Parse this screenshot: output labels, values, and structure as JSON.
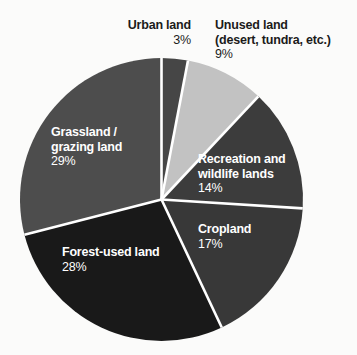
{
  "chart_data": {
    "type": "pie",
    "title": "",
    "subtitle": "",
    "xlabel": "",
    "ylabel": "",
    "legend_position": "none",
    "grid": false,
    "unit": "%",
    "start_angle_deg": 0,
    "direction": "clockwise",
    "categories": [
      "Urban land",
      "Unused land (desert, tundra, etc.)",
      "Recreation and wildlife lands",
      "Cropland",
      "Forest-used land",
      "Grassland / grazing land"
    ],
    "values": [
      3,
      9,
      14,
      17,
      28,
      29
    ],
    "slices": [
      {
        "id": "urban",
        "name_line1": "Urban land",
        "name_line2": "",
        "label": "Urban land",
        "percent_text": "3%",
        "value": 3,
        "color": "#464646",
        "label_placement": "outside"
      },
      {
        "id": "unused",
        "name_line1": "Unused land",
        "name_line2": "(desert, tundra, etc.)",
        "label": "Unused land (desert, tundra, etc.)",
        "percent_text": "9%",
        "value": 9,
        "color": "#c2c2c2",
        "label_placement": "outside"
      },
      {
        "id": "recreation",
        "name_line1": "Recreation and",
        "name_line2": "wildlife lands",
        "label": "Recreation and wildlife lands",
        "percent_text": "14%",
        "value": 14,
        "color": "#3c3c3c",
        "label_placement": "inside"
      },
      {
        "id": "cropland",
        "name_line1": "Cropland",
        "name_line2": "",
        "label": "Cropland",
        "percent_text": "17%",
        "value": 17,
        "color": "#383838",
        "label_placement": "inside"
      },
      {
        "id": "forest",
        "name_line1": "Forest-used land",
        "name_line2": "",
        "label": "Forest-used land",
        "percent_text": "28%",
        "value": 28,
        "color": "#191919",
        "label_placement": "inside"
      },
      {
        "id": "grassland",
        "name_line1": "Grassland /",
        "name_line2": "grazing land",
        "label": "Grassland / grazing land",
        "percent_text": "29%",
        "value": 29,
        "color": "#4d4d4d",
        "label_placement": "inside"
      }
    ],
    "separator_color": "#ffffff",
    "background_color": "#fbfbfa"
  }
}
